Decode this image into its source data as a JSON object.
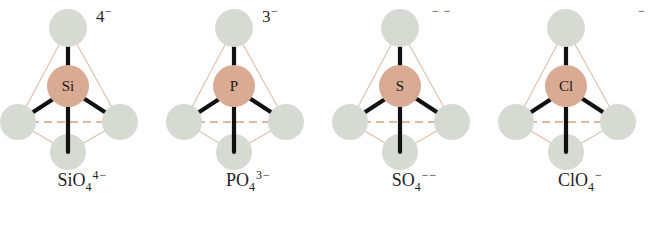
{
  "figure": {
    "background_color": "#ffffff",
    "central_atom_color": "#d9ab92",
    "oxygen_atom_color": "#d5dbd3",
    "bond_color": "#111111",
    "edge_color": "#d8b49c",
    "text_color": "#232323"
  },
  "units": [
    {
      "id": "silicate",
      "center_atom": "Si",
      "charge_top": "4",
      "charge_top_sign": "−",
      "formula_main": "SiO",
      "formula_sub": "4",
      "formula_sup": "4−"
    },
    {
      "id": "phosphate",
      "center_atom": "P",
      "charge_top": "3",
      "charge_top_sign": "−",
      "formula_main": "PO",
      "formula_sub": "4",
      "formula_sup": "3−"
    },
    {
      "id": "sulfate",
      "center_atom": "S",
      "charge_top": "",
      "charge_top_sign": "− −",
      "formula_main": "SO",
      "formula_sub": "4",
      "formula_sup": "−−"
    },
    {
      "id": "perchlorate",
      "center_atom": "Cl",
      "charge_top": "",
      "charge_top_sign": "−",
      "formula_main": "ClO",
      "formula_sub": "4",
      "formula_sup": "−"
    }
  ]
}
